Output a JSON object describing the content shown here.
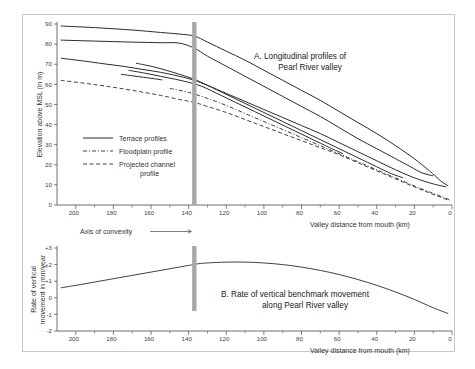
{
  "figure": {
    "background_color": "#ffffff",
    "frame_color": "#c8c8c8",
    "line_color": "#2b2b2b",
    "convexity_bar_color": "#a8a8a8"
  },
  "annotations": {
    "axis_of_convexity_label": "Axis of convexity",
    "axis_of_convexity_x_km": 137
  },
  "legend": {
    "items": [
      {
        "label": "Terrace profiles",
        "style": "solid"
      },
      {
        "label": "Floodplain profile",
        "style": "dash-dot"
      },
      {
        "label": "Projected channel profile",
        "style": "dashed"
      }
    ]
  },
  "chart_data": [
    {
      "type": "line",
      "panel": "A",
      "title": "A.  Longitudinal profiles of Pearl River valley",
      "title_line1": "A.  Longitudinal profiles of",
      "title_line2": "Pearl River valley",
      "xlabel": "Valley distance from mouth (km)",
      "ylabel": "Elevation above MSL (in m)",
      "xlim": [
        210,
        0
      ],
      "ylim": [
        0,
        90
      ],
      "xticks": [
        200,
        180,
        160,
        140,
        120,
        100,
        80,
        60,
        40,
        20,
        0
      ],
      "yticks": [
        0,
        10,
        20,
        30,
        40,
        50,
        60,
        70,
        80,
        90
      ],
      "x_axis_reversed": true,
      "grid": false,
      "legend_position": "inside-left",
      "series": [
        {
          "name": "Terrace profile T1 (highest)",
          "style": "solid",
          "x": [
            208,
            190,
            170,
            155,
            145,
            137,
            130,
            120,
            110,
            100,
            90,
            80,
            70,
            60,
            50,
            40,
            30,
            20,
            12,
            6,
            2
          ],
          "y": [
            89.0,
            88.2,
            87.0,
            85.8,
            85.0,
            84.0,
            81.0,
            76.5,
            72.0,
            67.0,
            62.0,
            57.0,
            52.0,
            46.5,
            41.0,
            35.5,
            29.5,
            23.0,
            17.0,
            12.0,
            9.5
          ]
        },
        {
          "name": "Terrace profile T2",
          "style": "solid",
          "x": [
            208,
            190,
            170,
            155,
            145,
            137,
            130,
            120,
            110,
            100,
            90,
            80,
            70,
            60,
            50,
            40,
            30,
            22,
            16,
            10
          ],
          "y": [
            82.0,
            81.5,
            81.0,
            80.7,
            80.5,
            78.0,
            74.0,
            69.0,
            64.0,
            59.0,
            54.0,
            49.0,
            44.0,
            38.5,
            33.0,
            28.0,
            23.0,
            19.0,
            16.0,
            14.5
          ]
        },
        {
          "name": "Terrace profile T3",
          "style": "solid",
          "x": [
            208,
            195,
            185,
            175,
            165,
            155,
            145,
            137,
            130,
            120,
            110,
            100,
            90,
            80,
            70,
            60,
            50,
            40,
            30,
            20,
            10,
            3
          ],
          "y": [
            73.0,
            71.5,
            70.2,
            69.0,
            67.5,
            66.0,
            64.0,
            62.0,
            59.5,
            55.5,
            51.5,
            47.5,
            43.5,
            39.5,
            35.5,
            31.0,
            26.5,
            22.0,
            17.5,
            13.5,
            10.5,
            9.0
          ]
        },
        {
          "name": "Terrace profile T4",
          "style": "solid",
          "x": [
            168,
            160,
            152,
            145,
            137,
            130,
            120,
            110,
            100,
            90,
            80,
            70,
            60,
            50,
            40,
            32,
            26
          ],
          "y": [
            70.5,
            69.0,
            67.0,
            65.0,
            62.5,
            59.5,
            55.0,
            50.5,
            46.0,
            41.5,
            37.0,
            32.5,
            28.0,
            23.5,
            19.0,
            15.5,
            13.5
          ]
        },
        {
          "name": "Terrace profile T5",
          "style": "solid",
          "x": [
            172,
            163,
            155,
            147,
            140,
            133,
            125,
            115,
            105,
            95,
            85,
            75,
            65,
            58
          ],
          "y": [
            67.0,
            65.5,
            64.0,
            62.5,
            61.0,
            59.0,
            55.5,
            51.0,
            46.5,
            42.0,
            37.5,
            33.0,
            28.5,
            25.5
          ]
        },
        {
          "name": "Terrace profile T6 (short)",
          "style": "solid",
          "x": [
            176,
            168,
            160,
            154
          ],
          "y": [
            65.0,
            64.0,
            63.0,
            62.2
          ]
        },
        {
          "name": "Floodplain profile",
          "style": "dash-dot",
          "x": [
            150,
            140,
            130,
            120,
            110,
            100,
            90,
            80,
            70,
            60,
            50,
            40,
            30,
            20,
            12,
            5,
            1
          ],
          "y": [
            58.0,
            56.0,
            53.0,
            49.5,
            45.5,
            41.5,
            37.5,
            33.5,
            29.5,
            25.5,
            21.5,
            17.5,
            13.5,
            9.5,
            6.5,
            4.0,
            2.5
          ]
        },
        {
          "name": "Projected channel profile",
          "style": "dashed",
          "x": [
            208,
            195,
            185,
            175,
            165,
            155,
            145,
            137,
            130,
            120,
            110,
            100,
            90,
            80,
            70,
            60,
            50,
            40,
            30,
            20,
            12,
            5,
            1
          ],
          "y": [
            62.0,
            60.5,
            59.2,
            57.8,
            56.2,
            54.5,
            52.5,
            51.0,
            49.0,
            46.0,
            42.5,
            39.0,
            35.5,
            32.0,
            28.5,
            25.0,
            21.0,
            17.0,
            13.0,
            9.0,
            6.0,
            3.5,
            2.0
          ]
        }
      ]
    },
    {
      "type": "line",
      "panel": "B",
      "title": "B.  Rate of vertical benchmark movement along Pearl River valley",
      "title_line1": "B.  Rate of vertical benchmark movement",
      "title_line2": "along Pearl River valley",
      "xlabel": "Valley distance from mouth (km)",
      "ylabel": "Rate of vertical movement in mm/year",
      "ylabel_line1": "Rate of vertical",
      "ylabel_line2": "movement in mm/year",
      "xlim": [
        210,
        0
      ],
      "ylim": [
        -2,
        3
      ],
      "xticks": [
        200,
        180,
        160,
        140,
        120,
        100,
        80,
        60,
        40,
        20,
        0
      ],
      "yticks": [
        -2,
        -1,
        0,
        1,
        2,
        3
      ],
      "ytick_labels": [
        "-2",
        "-1",
        "0",
        "+1",
        "+2",
        "+3"
      ],
      "x_axis_reversed": true,
      "grid": false,
      "series": [
        {
          "name": "Rate of vertical benchmark movement",
          "style": "solid",
          "x": [
            208,
            200,
            190,
            180,
            170,
            160,
            150,
            140,
            135,
            130,
            120,
            110,
            100,
            90,
            80,
            70,
            60,
            50,
            40,
            30,
            20,
            10,
            2
          ],
          "y": [
            0.6,
            0.75,
            0.95,
            1.15,
            1.35,
            1.55,
            1.75,
            1.95,
            2.05,
            2.1,
            2.15,
            2.15,
            2.1,
            2.0,
            1.85,
            1.65,
            1.4,
            1.1,
            0.75,
            0.35,
            -0.1,
            -0.6,
            -0.95
          ]
        }
      ]
    }
  ]
}
